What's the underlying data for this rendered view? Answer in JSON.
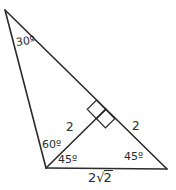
{
  "figure": {
    "type": "geometry-diagram",
    "stroke_color": "#2b2b2b",
    "background_color": "#ffffff",
    "labels": {
      "angle_apex": "30º",
      "angle_bottom_left_upper": "60º",
      "angle_bottom_left_lower": "45º",
      "angle_bottom_right": "45º",
      "side_cevian": "2",
      "side_right": "2",
      "side_base_coefficient": "2",
      "side_base_radical": "√",
      "side_base_radicand": "2",
      "side_base_full": "2√2"
    },
    "markers": {
      "right_angle": "double-square-right-angle-marker"
    }
  },
  "geometry": {
    "points": {
      "apex": {
        "x": 5,
        "y": 10
      },
      "bottom_left": {
        "x": 46,
        "y": 168
      },
      "bottom_right": {
        "x": 167,
        "y": 169
      },
      "cevian_foot": {
        "x": 106,
        "y": 109
      }
    },
    "edges": [
      {
        "name": "left-edge",
        "from": "apex",
        "to": "bottom_left"
      },
      {
        "name": "hypotenuse",
        "from": "apex",
        "to": "bottom_right"
      },
      {
        "name": "base-edge",
        "from": "bottom_left",
        "to": "bottom_right"
      },
      {
        "name": "cevian",
        "from": "bottom_left",
        "to": "cevian_foot"
      }
    ]
  }
}
